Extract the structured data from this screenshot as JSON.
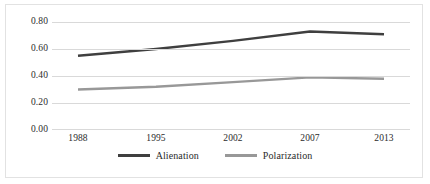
{
  "chart_data": {
    "type": "line",
    "title": "",
    "xlabel": "",
    "ylabel": "",
    "categories": [
      "1988",
      "1995",
      "2002",
      "2007",
      "2013"
    ],
    "ylim": [
      0.0,
      0.8
    ],
    "yticks": [
      "0.00",
      "0.20",
      "0.40",
      "0.60",
      "0.80"
    ],
    "ytick_values": [
      0.0,
      0.2,
      0.4,
      0.6,
      0.8
    ],
    "grid": true,
    "legend_position": "bottom-center",
    "series": [
      {
        "name": "Alienation",
        "color": "#3f3f3f",
        "values": [
          0.55,
          0.6,
          0.66,
          0.73,
          0.71
        ]
      },
      {
        "name": "Polarization",
        "color": "#989898",
        "values": [
          0.3,
          0.32,
          0.355,
          0.39,
          0.38
        ]
      }
    ]
  },
  "axes": {
    "y_tick_labels": [
      "0.80",
      "0.60",
      "0.40",
      "0.20",
      "0.00"
    ],
    "x_tick_labels": [
      "1988",
      "1995",
      "2002",
      "2007",
      "2013"
    ]
  },
  "legend": {
    "items": [
      {
        "label": "Alienation",
        "color": "#3f3f3f"
      },
      {
        "label": "Polarization",
        "color": "#989898"
      }
    ]
  },
  "colors": {
    "alienation": "#3f3f3f",
    "polarization": "#989898",
    "gridline": "#d9d9d9",
    "frame": "#e2e2e2",
    "text": "#2b2b2b",
    "background": "#ffffff"
  }
}
